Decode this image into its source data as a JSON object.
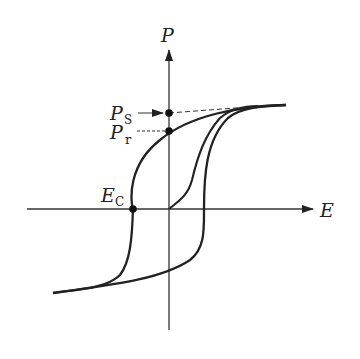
{
  "diagram": {
    "axes": {
      "x_label": "E",
      "y_label": "P"
    },
    "labels": {
      "ps_main": "P",
      "ps_sub": "S",
      "pr_main": "P",
      "pr_sub": "r",
      "ec_main": "E",
      "ec_sub": "C"
    },
    "points": [
      {
        "name": "Ps",
        "meaning": "saturation polarization"
      },
      {
        "name": "Pr",
        "meaning": "remanent polarization"
      },
      {
        "name": "Ec",
        "meaning": "coercive field"
      }
    ],
    "colors": {
      "stroke": "#222222",
      "background": "#ffffff"
    }
  }
}
